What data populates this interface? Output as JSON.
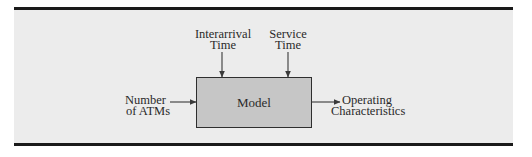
{
  "diagram": {
    "type": "block-diagram",
    "model": {
      "label": "Model"
    },
    "inputs": [
      {
        "id": "interarrival",
        "line1": "Interarrival",
        "line2": "Time",
        "direction": "top"
      },
      {
        "id": "service",
        "line1": "Service",
        "line2": "Time",
        "direction": "top"
      },
      {
        "id": "atms",
        "line1": "Number",
        "line2": "of ATMs",
        "direction": "left"
      }
    ],
    "outputs": [
      {
        "id": "operating",
        "line1": "Operating",
        "line2": "Characteristics",
        "direction": "right"
      }
    ],
    "colors": {
      "band": "#ececec",
      "rule": "#1a1a1a",
      "box_fill": "#c6c6c6",
      "box_border": "#2e2e2e",
      "arrow": "#3a3a3a",
      "text": "#2a2a2a"
    }
  }
}
